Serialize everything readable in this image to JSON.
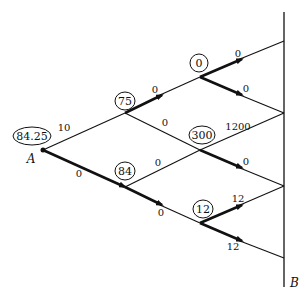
{
  "diagram": {
    "type": "lattice-network",
    "terminals": {
      "start": "A",
      "end": "B"
    },
    "nodes": [
      {
        "id": "A",
        "value": "84.25",
        "x": 43,
        "y": 150
      },
      {
        "id": "n1",
        "value": "75",
        "x": 125,
        "y": 113
      },
      {
        "id": "n2",
        "value": "84",
        "x": 125,
        "y": 187
      },
      {
        "id": "n3",
        "value": "0",
        "x": 200,
        "y": 77
      },
      {
        "id": "n4",
        "value": "300",
        "x": 200,
        "y": 150
      },
      {
        "id": "n5",
        "value": "12",
        "x": 200,
        "y": 223
      }
    ],
    "edges": [
      {
        "from": "A",
        "to": "n1",
        "label": "10",
        "bold": false
      },
      {
        "from": "A",
        "to": "n2",
        "label": "0",
        "bold": true
      },
      {
        "from": "n1",
        "to": "n3",
        "label": "0",
        "bold": true
      },
      {
        "from": "n1",
        "to": "n4",
        "label": "0",
        "bold": false
      },
      {
        "from": "n2",
        "to": "n4",
        "label": "0",
        "bold": false
      },
      {
        "from": "n2",
        "to": "n5",
        "label": "0",
        "bold": true
      },
      {
        "from": "n3",
        "to": "R1",
        "label": "0",
        "bold": true
      },
      {
        "from": "n3",
        "to": "R2",
        "label": "0",
        "bold": true
      },
      {
        "from": "n4",
        "to": "R2",
        "label": "1200",
        "bold": false
      },
      {
        "from": "n4",
        "to": "R3",
        "label": "0",
        "bold": true
      },
      {
        "from": "n5",
        "to": "R3",
        "label": "12",
        "bold": true
      },
      {
        "from": "n5",
        "to": "R4",
        "label": "12",
        "bold": true
      }
    ],
    "labels": {
      "A": "A",
      "B": "B",
      "node_A": "84.25",
      "node_n1": "75",
      "node_n2": "84",
      "node_n3": "0",
      "node_n4": "300",
      "node_n5": "12",
      "e_A_n1": "10",
      "e_A_n2": "0",
      "e_n1_n3": "0",
      "e_n1_n4": "0",
      "e_n2_n4": "0",
      "e_n2_n5": "0",
      "e_n3_R1": "0",
      "e_n3_R2": "0",
      "e_n4_R2": "1200",
      "e_n4_R3": "0",
      "e_n5_R3": "12",
      "e_n5_R4": "12"
    }
  }
}
